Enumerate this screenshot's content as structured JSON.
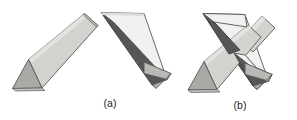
{
  "figure": {
    "background_color": "#ffffff",
    "stroke_color": "#5a5a5a",
    "stroke_width": 0.8,
    "palette": {
      "face_light": "#ededea",
      "face_lighter": "#f4f4f2",
      "face_mid": "#c9c9c6",
      "face_mid2": "#bfbfbc",
      "face_dark": "#5d5d5d",
      "face_darker": "#4f4f4f",
      "face_shadow": "#a9a9a6",
      "face_gray": "#b3b3b0"
    },
    "captions": [
      {
        "id": "a",
        "label": "(a)",
        "description": "Two separate triangular prisms"
      },
      {
        "id": "b",
        "label": "(b)",
        "description": "The same prisms crossed in an X"
      }
    ],
    "objects": [
      {
        "name": "prism-a-left",
        "group": "a",
        "description": "Triangular prism oriented from lower-left to upper-right, light top face with darker triangular end cap at lower left",
        "faces": [
          {
            "name": "top-face",
            "points": "27,60 85,14 98,26 40,88",
            "fill": "#cfcfcc"
          },
          {
            "name": "side-face",
            "points": "12,88 27,60 40,88",
            "fill": "#a8a8a5"
          },
          {
            "name": "front-face",
            "points": "12,88 40,88 46,93 18,93",
            "fill": "#c4c4c1"
          },
          {
            "name": "end-sliver",
            "points": "85,14 98,26 96,28 84,16",
            "fill": "#bdbdba"
          }
        ]
      },
      {
        "name": "prism-a-right",
        "group": "a",
        "description": "Triangular prism oriented from upper-left to lower-right, bright top face, dark left face, gray triangular end cap at lower right",
        "faces": [
          {
            "name": "left-dark-face",
            "points": "101,12 112,21 166,79 151,83",
            "fill": "#555555"
          },
          {
            "name": "top-bright-face",
            "points": "101,12 143,13 166,79 112,21",
            "fill": "#f0f0ee"
          },
          {
            "name": "end-cap-face",
            "points": "166,79 143,73 143,62 170,73",
            "fill": "#b8b8b5"
          },
          {
            "name": "end-cap-lower",
            "points": "151,83 166,79 170,73 155,88",
            "fill": "#aeaeab"
          }
        ]
      },
      {
        "name": "prism-b-down",
        "group": "b",
        "description": "Prism in the crossed pair running from upper-left down to lower-right, dark shaded left face",
        "faces": [
          {
            "name": "left-dark-face",
            "points": "203,14 213,22 268,81 253,86",
            "fill": "#555555"
          },
          {
            "name": "top-bright-face",
            "points": "203,14 245,15 268,81 213,22",
            "fill": "#efefed",
            "occluded": true
          },
          {
            "name": "end-cap-face",
            "points": "268,81 245,75 245,64 272,75",
            "fill": "#b8b8b5"
          },
          {
            "name": "end-cap-lower",
            "points": "253,86 268,81 272,75 257,90",
            "fill": "#aeaeab"
          }
        ]
      },
      {
        "name": "prism-b-up",
        "group": "b",
        "description": "Prism in the crossed pair running from lower-left up to upper-right, passing in front of and behind the other prism",
        "faces": [
          {
            "name": "top-face",
            "points": "203,62 261,16 274,28 216,90",
            "fill": "#cfcfcc"
          },
          {
            "name": "side-face",
            "points": "188,90 203,62 216,90",
            "fill": "#a8a8a5"
          },
          {
            "name": "front-face",
            "points": "188,90 216,90 222,95 194,95",
            "fill": "#c4c4c1"
          }
        ]
      }
    ]
  }
}
